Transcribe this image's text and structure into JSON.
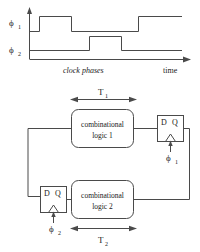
{
  "figure": {
    "timing": {
      "signals": [
        {
          "name": "phi1",
          "label": "ϕ",
          "subscript": "1"
        },
        {
          "name": "phi2",
          "label": "ϕ",
          "subscript": "2"
        }
      ],
      "caption": "clock phases",
      "axis_label": "time"
    },
    "circuit": {
      "blocks": [
        {
          "name": "combinational-logic-1",
          "line1": "combinational",
          "line2": "logic 1"
        },
        {
          "name": "combinational-logic-2",
          "line1": "combinational",
          "line2": "logic 2"
        }
      ],
      "flipflops": [
        {
          "name": "flipflop-1",
          "d": "D",
          "q": "Q",
          "clock_label": "ϕ",
          "clock_sub": "1"
        },
        {
          "name": "flipflop-2",
          "d": "D",
          "q": "Q",
          "clock_label": "ϕ",
          "clock_sub": "2"
        }
      ],
      "dimensions": [
        {
          "name": "T1",
          "label": "T",
          "subscript": "1"
        },
        {
          "name": "T2",
          "label": "T",
          "subscript": "2"
        }
      ]
    },
    "colors": {
      "ink": "#4a4a4a",
      "text": "#1a1a1a",
      "background": "#ffffff"
    }
  }
}
